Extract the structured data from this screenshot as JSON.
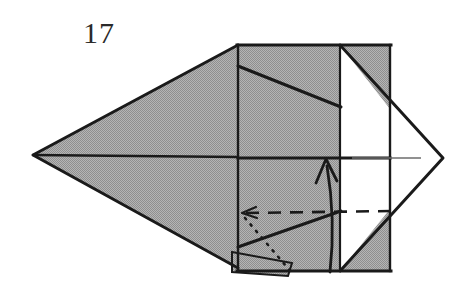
{
  "figure": {
    "kind": "origami-fold-diagram",
    "step_number": "17",
    "canvas": {
      "width": 475,
      "height": 283,
      "background": "#ffffff"
    },
    "palette": {
      "paper_front_gray": "#a3a3a3",
      "paper_back_white": "#ffffff",
      "outline": "#1a1a1a",
      "thin_crease": "#6d6d6d",
      "number_color": "#2a2a2a"
    },
    "shapes": [
      {
        "name": "left-large-kite",
        "fill": "paper_front_gray",
        "points": "33,155 238,45 238,268 33,155"
      },
      {
        "name": "center-panel-upper",
        "fill": "paper_front_gray",
        "points": "238,45 390,45 390,158 238,158"
      },
      {
        "name": "center-panel-lower",
        "fill": "paper_front_gray",
        "points": "238,158 390,158 390,271 238,271"
      },
      {
        "name": "right-white-diamond",
        "fill": "paper_back_white",
        "points": "340,45 443,158 340,271"
      },
      {
        "name": "right-top-gray-triangle",
        "fill": "paper_front_gray",
        "points": "340,45 390,45 390,109"
      },
      {
        "name": "right-bottom-gray-triangle",
        "fill": "paper_front_gray",
        "points": "340,271 390,271 390,209"
      },
      {
        "name": "bottom-tab-flap",
        "fill": "paper_front_gray",
        "points": "232,252 292,263 288,276 232,272"
      }
    ],
    "creases": [
      {
        "name": "center-horizontal-axis",
        "style": "solid-outline",
        "from": "33,155",
        "to": "390,158"
      },
      {
        "name": "upper-diagonal-crease",
        "style": "solid-outline",
        "from": "238,66",
        "to": "340,106"
      },
      {
        "name": "lower-diagonal-crease",
        "style": "solid-outline",
        "from": "238,247",
        "to": "340,212"
      },
      {
        "name": "panel-left-edge",
        "style": "solid-outline",
        "from": "238,45",
        "to": "238,271"
      },
      {
        "name": "panel-right-edge",
        "style": "solid-outline",
        "from": "390,45",
        "to": "390,271"
      },
      {
        "name": "white-diamond-midline",
        "style": "thin-gray",
        "from": "352,158",
        "to": "421,158"
      },
      {
        "name": "valley-fold-dashed",
        "style": "dashed",
        "from": "243,213",
        "to": "392,211"
      },
      {
        "name": "hidden-edge-dotted",
        "style": "dotted",
        "from": "245,218",
        "to": "292,272"
      }
    ],
    "arrows": [
      {
        "name": "fold-up-curved-arrow",
        "type": "curved-solid-arrow",
        "head_at": "326,160",
        "tail_at": "330,272"
      },
      {
        "name": "dashed-line-pointer",
        "type": "small-arrowhead",
        "head_at": "243,213"
      }
    ]
  }
}
